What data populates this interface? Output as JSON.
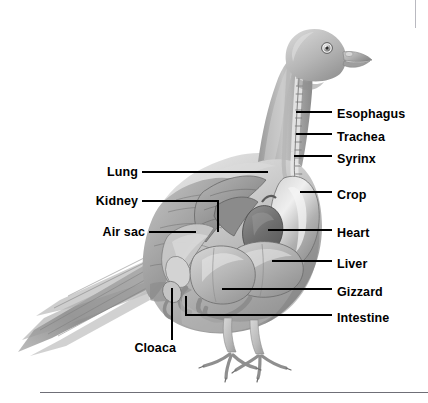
{
  "figure": {
    "view": "left-lateral-profile",
    "style": "grayscale-pencil-illustration",
    "background_color": "#ffffff",
    "ink_color": "#000000"
  },
  "labels": {
    "esophagus": "Esophagus",
    "trachea": "Trachea",
    "syrinx": "Syrinx",
    "crop": "Crop",
    "heart": "Heart",
    "liver": "Liver",
    "gizzard": "Gizzard",
    "intestine": "Intestine",
    "lung": "Lung",
    "kidney": "Kidney",
    "air_sac": "Air sac",
    "cloaca": "Cloaca"
  },
  "label_layout": [
    {
      "key": "esophagus",
      "side": "right",
      "x": 337,
      "y": 108
    },
    {
      "key": "trachea",
      "side": "right",
      "x": 337,
      "y": 131
    },
    {
      "key": "syrinx",
      "side": "right",
      "x": 337,
      "y": 153
    },
    {
      "key": "crop",
      "side": "right",
      "x": 337,
      "y": 189
    },
    {
      "key": "heart",
      "side": "right",
      "x": 337,
      "y": 227
    },
    {
      "key": "liver",
      "side": "right",
      "x": 337,
      "y": 258
    },
    {
      "key": "gizzard",
      "side": "right",
      "x": 337,
      "y": 286
    },
    {
      "key": "intestine",
      "side": "right",
      "x": 337,
      "y": 312
    },
    {
      "key": "lung",
      "side": "left",
      "x": 138,
      "y": 169
    },
    {
      "key": "kidney",
      "side": "left",
      "x": 138,
      "y": 198
    },
    {
      "key": "air_sac",
      "side": "left",
      "x": 145,
      "y": 229
    },
    {
      "key": "cloaca",
      "side": "left",
      "x": 176,
      "y": 348
    }
  ],
  "rules": {
    "bottom_divider": {
      "x": 40,
      "y": 392,
      "width": 388,
      "height": 1
    },
    "top_right_mark": {
      "x": 415,
      "y": 0,
      "width": 1,
      "height": 28
    }
  }
}
